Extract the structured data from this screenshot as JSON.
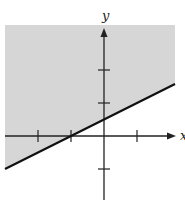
{
  "chart_data": {
    "type": "line",
    "title": "",
    "xlabel": "x",
    "ylabel": "y",
    "xlim": [
      -3.1,
      2.2
    ],
    "ylim": [
      -2.0,
      3.4
    ],
    "x_ticks": [
      -2,
      -1,
      1
    ],
    "y_ticks": [
      -1,
      1,
      2
    ],
    "grid": false,
    "legend": null,
    "series": [
      {
        "name": "boundary",
        "equation": "y = 0.5x + 0.5",
        "style": "solid",
        "x": [
          -3.1,
          2.2
        ],
        "y": [
          -1.05,
          1.6
        ]
      }
    ],
    "shaded_region": {
      "side": "above",
      "inequality": "y >= 0.5x + 0.5",
      "color": "#d6d6d6"
    },
    "intercepts": {
      "x": -1,
      "y": 0.5
    }
  },
  "colors": {
    "shade": "#d6d6d6",
    "axis": "#222222",
    "line": "#111111",
    "background": "#ffffff"
  },
  "labels": {
    "x_axis": "x",
    "y_axis": "y"
  }
}
